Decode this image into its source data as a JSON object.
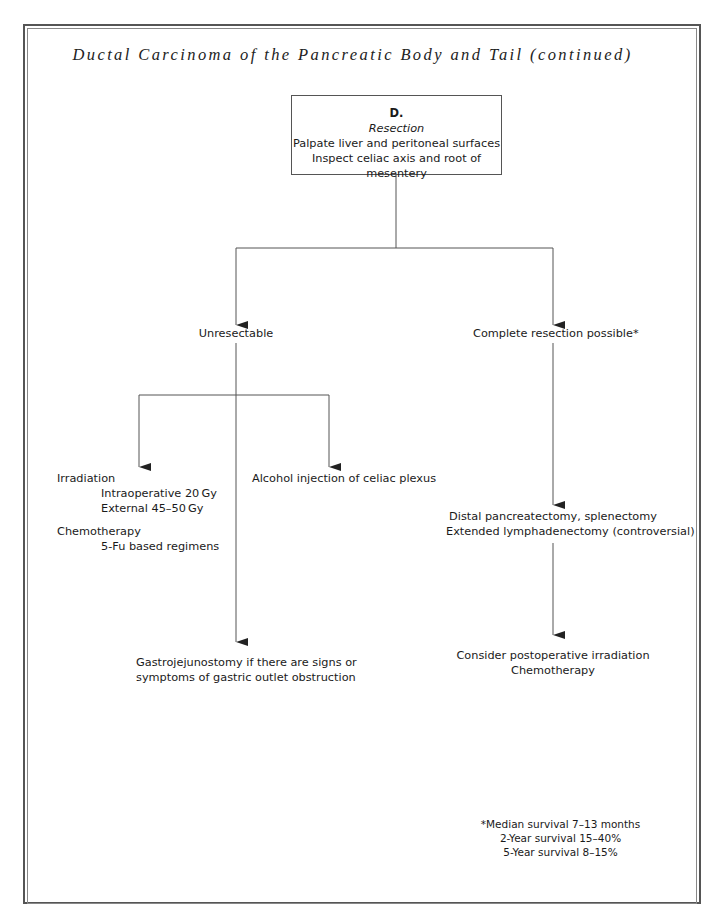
{
  "title": "Ductal Carcinoma of the Pancreatic Body and Tail (continued)",
  "root_box": {
    "letter": "D.",
    "subtitle": "Resection",
    "line1": "Palpate liver and peritoneal surfaces",
    "line2": "Inspect celiac axis and root of mesentery"
  },
  "branches": {
    "left": {
      "label": "Unresectable",
      "children": {
        "irradiation": {
          "heading": "Irradiation",
          "items": [
            "Intraoperative 20 Gy",
            "External 45–50 Gy"
          ]
        },
        "chemotherapy": {
          "heading": "Chemotherapy",
          "items": [
            "5-Fu based regimens"
          ]
        },
        "alcohol": "Alcohol injection of celiac plexus",
        "gastro": {
          "line1": "Gastrojejunostomy if there are signs or",
          "line2": "symptoms of gastric outlet obstruction"
        }
      }
    },
    "right": {
      "label": "Complete resection possible*",
      "surgery": {
        "line1": "Distal pancreatectomy, splenectomy",
        "line2": "Extended lymphadenectomy (controversial)"
      },
      "postop": {
        "line1": "Consider postoperative irradiation",
        "line2": "Chemotherapy"
      }
    }
  },
  "footnote": {
    "line1": "*Median survival 7–13 months",
    "line2": "2-Year survival 15–40%",
    "line3": "5-Year survival 8–15%"
  },
  "colors": {
    "line": "#555555",
    "text": "#1a1a1a",
    "border": "#555555"
  }
}
